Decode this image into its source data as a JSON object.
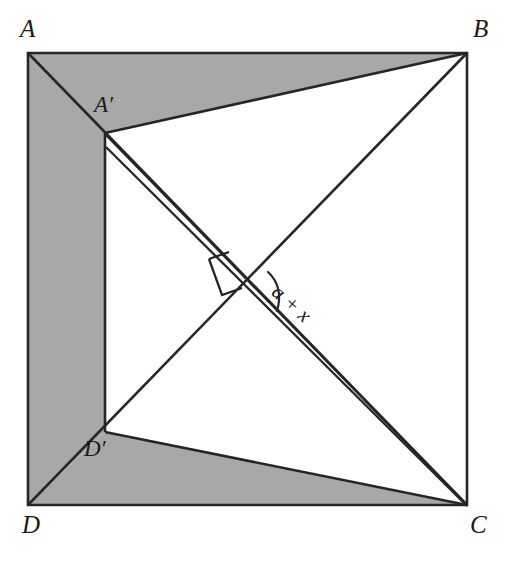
{
  "figure": {
    "type": "geometry-diagram",
    "background_color": "#ffffff",
    "shade_color": "#a8a8a8",
    "stroke_color": "#262626",
    "canvas": {
      "width": 513,
      "height": 563
    }
  },
  "vertices": {
    "A": {
      "label": "A",
      "x": 28,
      "y": 53,
      "label_x": 20,
      "label_y": 16
    },
    "B": {
      "label": "B",
      "x": 467,
      "y": 53,
      "label_x": 473,
      "label_y": 16
    },
    "C": {
      "label": "C",
      "x": 467,
      "y": 505,
      "label_x": 470,
      "label_y": 512
    },
    "D": {
      "label": "D",
      "x": 28,
      "y": 505,
      "label_x": 22,
      "label_y": 512
    },
    "Ap": {
      "label": "A′",
      "x": 105,
      "y": 133,
      "label_x": 94,
      "label_y": 93
    },
    "Dp": {
      "label": "D′",
      "x": 105,
      "y": 432,
      "label_x": 84,
      "label_y": 437
    }
  },
  "annotations": {
    "angle_label": {
      "text": "a + x",
      "x": 282,
      "y": 281,
      "rotation_deg": 42
    },
    "right_angle_marker": {
      "name": "right-angle-square",
      "size": 26
    }
  },
  "shapes": {
    "outer_square": "square ABCD",
    "shaded_region": "A → A′ → B edge band, left strip A′D′, and D′ → C band",
    "diagonal_AC": "A to C",
    "diagonal_BD": "B to D",
    "fold_line_ApC": "A′ to C double line"
  }
}
